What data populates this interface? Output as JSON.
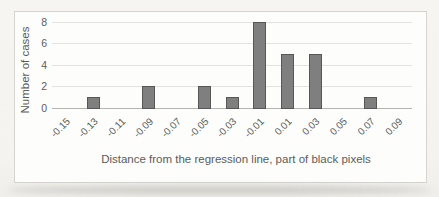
{
  "chart_data": {
    "type": "bar",
    "title": "",
    "categories": [
      "-0.15",
      "-0.13",
      "-0.11",
      "-0.09",
      "-0.07",
      "-0.05",
      "-0.03",
      "-0.01",
      "0.01",
      "0.03",
      "0.05",
      "0.07",
      "0.09"
    ],
    "values": [
      0,
      1,
      0,
      2,
      0,
      2,
      1,
      8,
      5,
      5,
      0,
      1,
      0
    ],
    "xlabel": "Distance from the regression line, part of black pixels",
    "ylabel": "Number of cases",
    "ylim": [
      0,
      8
    ],
    "yticks": [
      0,
      2,
      4,
      6,
      8
    ],
    "grid": "horizontal-light",
    "legend": "none",
    "x_tick_rotation_deg": 45
  },
  "style": {
    "bar_fill": "#7f7f7f",
    "bar_border": "#575757",
    "gridline": "#e4e3e0",
    "axis_line": "#b6b4b0",
    "text_color": "#5c5c5a",
    "frame_border": "#d6d4d0",
    "chart_bg": "#fdfdfc",
    "page_bg": "#f5f4f1"
  }
}
